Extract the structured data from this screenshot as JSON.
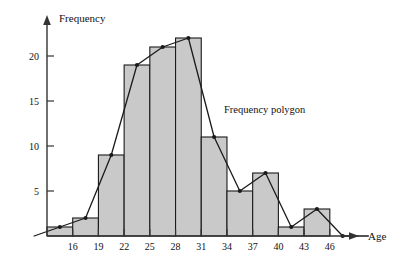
{
  "chart_data": {
    "type": "bar",
    "title": "",
    "xlabel": "Age",
    "ylabel": "Frequency",
    "categories": [
      "13-16",
      "16-19",
      "19-22",
      "22-25",
      "25-28",
      "28-31",
      "31-34",
      "34-37",
      "37-40",
      "40-43",
      "43-46",
      "46-49"
    ],
    "bin_edges": [
      13,
      16,
      19,
      22,
      25,
      28,
      31,
      34,
      37,
      40,
      43,
      46,
      49
    ],
    "bin_midpoints": [
      14.5,
      17.5,
      20.5,
      23.5,
      26.5,
      29.5,
      32.5,
      35.5,
      38.5,
      41.5,
      44.5,
      47.5
    ],
    "values": [
      1,
      2,
      9,
      19,
      21,
      22,
      11,
      5,
      7,
      1,
      3,
      0
    ],
    "xlim": [
      13,
      52
    ],
    "ylim": [
      0,
      23
    ],
    "xticks": [
      16,
      19,
      22,
      25,
      28,
      31,
      34,
      37,
      40,
      43,
      46
    ],
    "xtick_labels": [
      "16",
      "19",
      "22",
      "25",
      "28",
      "31",
      "34",
      "37",
      "40",
      "43",
      "46"
    ],
    "yticks": [
      5,
      10,
      15,
      20
    ],
    "ytick_labels": [
      "5",
      "10",
      "15",
      "20"
    ],
    "grid": false,
    "legend_position": "none",
    "annotations": [
      {
        "name": "frequency-polygon-label",
        "text": "Frequency polygon",
        "x": 224,
        "y": 113
      }
    ],
    "series": [
      {
        "name": "Histogram",
        "type": "bar",
        "values": [
          1,
          2,
          9,
          19,
          21,
          22,
          11,
          5,
          7,
          1,
          3,
          0
        ],
        "fill_color": "#c9c9c9",
        "edge_color": "#1a1a1a"
      },
      {
        "name": "Frequency polygon",
        "type": "line",
        "x": [
          11.5,
          14.5,
          17.5,
          20.5,
          23.5,
          26.5,
          29.5,
          32.5,
          35.5,
          38.5,
          41.5,
          44.5,
          47.5,
          50.5
        ],
        "values": [
          0,
          1,
          2,
          9,
          19,
          21,
          22,
          11,
          5,
          7,
          1,
          3,
          0,
          0
        ],
        "line_color": "#1a1a1a",
        "marker": "dot"
      }
    ]
  },
  "axes": {
    "y_axis_title": "Frequency",
    "x_axis_title": "Age"
  },
  "colors": {
    "bar_fill": "#c9c9c9",
    "bar_edge": "#1a1a1a",
    "axis": "#333333",
    "polygon_line": "#1a1a1a",
    "text": "#111111",
    "background": "#ffffff"
  }
}
